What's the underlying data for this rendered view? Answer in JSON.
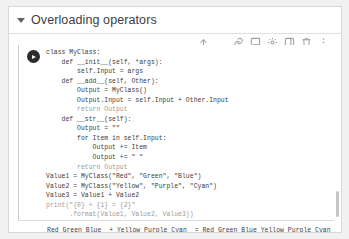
{
  "section": {
    "title": "Overloading operators",
    "caret_icon": "caret-down-icon"
  },
  "toolbar": {
    "move_up_label": "↑",
    "icons": [
      {
        "name": "move-cell-up-icon",
        "label": "Move cell up"
      },
      {
        "name": "link-icon",
        "label": "Copy link to cell"
      },
      {
        "name": "comment-icon",
        "label": "Add a comment"
      },
      {
        "name": "settings-icon",
        "label": "Cell settings"
      },
      {
        "name": "mirror-cell-icon",
        "label": "Mirror cell in tab"
      },
      {
        "name": "delete-icon",
        "label": "Delete cell"
      },
      {
        "name": "more-vert-icon",
        "label": "More cell actions"
      }
    ]
  },
  "cell": {
    "run_button_label": "Run cell",
    "code_lines": [
      "class MyClass:",
      "    def __init__(self, *args):",
      "        self.Input = args",
      "    def __add__(self, Other):",
      "        Output = MyClass()",
      "        Output.Input = self.Input + Other.Input",
      "        return Output",
      "    def __str__(self):",
      "        Output = \"\"",
      "        for Item in self.Input:",
      "            Output += Item",
      "            Output += \" \"",
      "        return Output",
      "",
      "Value1 = MyClass(\"Red\", \"Green\", \"Blue\")",
      "Value2 = MyClass(\"Yellow\", \"Purple\", \"Cyan\")",
      "Value3 = Value1 + Value2",
      "print(\"{0} + {1} = {2}\"",
      "      .format(Value1, Value2, Value3))"
    ]
  },
  "output": {
    "text": "Red Green Blue  + Yellow Purple Cyan  = Red Green Blue Yellow Purple Cyan"
  },
  "colors": {
    "page_background": "#f1f1f1",
    "card_background": "#ffffff",
    "code_text": "#3b3b3b",
    "keyword_gray": "#9d9d9d",
    "run_button": "#2b2b2b",
    "divider": "#e0e0e0",
    "scrollbar_thumb": "#c6c6c6"
  }
}
